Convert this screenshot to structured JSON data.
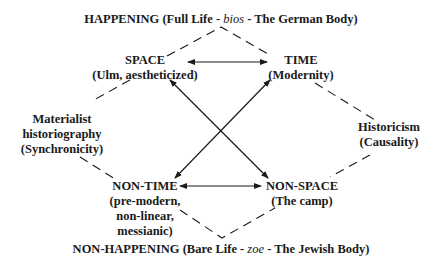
{
  "top_title": {
    "prefix": "HAPPENING (Full Life - ",
    "italic": "bios",
    "suffix": " - The German Body)"
  },
  "bottom_title": {
    "prefix": "NON-HAPPENING (Bare Life - ",
    "italic": "zoe",
    "suffix": " - The Jewish Body)"
  },
  "nodes": {
    "space": {
      "title": "SPACE",
      "subtitle": "(Ulm, aestheticized)"
    },
    "time": {
      "title": "TIME",
      "subtitle": "(Modernity)"
    },
    "non_time": {
      "title": "NON-TIME",
      "lines": [
        "(pre-modern,",
        "non-linear,",
        "messianic)"
      ]
    },
    "non_space": {
      "title": "NON-SPACE",
      "subtitle": "(The camp)"
    }
  },
  "side_labels": {
    "left": [
      "Materialist",
      "historiography",
      "(Synchronicity)"
    ],
    "right": [
      "Historicism",
      "(Causality)"
    ]
  },
  "colors": {
    "ink": "#1a1a1a",
    "background": "#ffffff"
  }
}
